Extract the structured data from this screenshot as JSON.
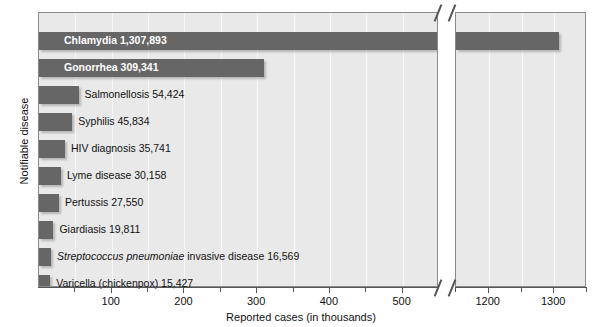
{
  "chart_data": {
    "type": "bar",
    "orientation": "horizontal",
    "title": "",
    "xlabel": "Reported cases (in thousands)",
    "ylabel": "Notifiable disease",
    "grid": true,
    "legend": null,
    "axis_break": {
      "present": true,
      "after": 550,
      "resumes_at": 1150
    },
    "xlim_left": [
      0,
      550
    ],
    "xlim_right": [
      1150,
      1350
    ],
    "xticks": [
      100,
      200,
      300,
      400,
      500,
      1200,
      1300
    ],
    "xtick_labels": [
      "100",
      "200",
      "300",
      "400",
      "500",
      "1200",
      "1300"
    ],
    "xtick_minor": [
      50,
      150,
      250,
      350,
      450,
      1150,
      1250,
      1350
    ],
    "units": "thousands of reported cases",
    "categories": [
      "Chlamydia",
      "Gonorrhea",
      "Salmonellosis",
      "Syphilis",
      "HIV diagnosis",
      "Lyme disease",
      "Pertussis",
      "Giardiasis",
      "Streptococcus pneumoniae invasive disease",
      "Varicella (chickenpox)"
    ],
    "values": [
      1307.893,
      309.341,
      54.424,
      45.834,
      35.741,
      30.158,
      27.55,
      19.811,
      16.569,
      15.427
    ],
    "value_labels": [
      "1,307,893",
      "309,341",
      "54,424",
      "45,834",
      "35,741",
      "30,158",
      "27,550",
      "19,811",
      "16,569",
      "15,427"
    ],
    "bars": [
      {
        "name": "Chlamydia",
        "value": 1307.893,
        "label": "Chlamydia  1,307,893",
        "label_inside": true,
        "italic_prefix": ""
      },
      {
        "name": "Gonorrhea",
        "value": 309.341,
        "label": "Gonorrhea  309,341",
        "label_inside": true,
        "italic_prefix": ""
      },
      {
        "name": "Salmonellosis",
        "value": 54.424,
        "label": "Salmonellosis  54,424",
        "label_inside": false,
        "italic_prefix": ""
      },
      {
        "name": "Syphilis",
        "value": 45.834,
        "label": "Syphilis  45,834",
        "label_inside": false,
        "italic_prefix": ""
      },
      {
        "name": "HIV diagnosis",
        "value": 35.741,
        "label": "HIV diagnosis 35,741",
        "label_inside": false,
        "italic_prefix": ""
      },
      {
        "name": "Lyme disease",
        "value": 30.158,
        "label": "Lyme disease  30,158",
        "label_inside": false,
        "italic_prefix": ""
      },
      {
        "name": "Pertussis",
        "value": 27.55,
        "label": "Pertussis  27,550",
        "label_inside": false,
        "italic_prefix": ""
      },
      {
        "name": "Giardiasis",
        "value": 19.811,
        "label": "Giardiasis  19,811",
        "label_inside": false,
        "italic_prefix": ""
      },
      {
        "name": "Streptococcus pneumoniae invasive disease",
        "value": 16.569,
        "label": " invasive disease  16,569",
        "label_inside": false,
        "italic_prefix": "Streptococcus pneumoniae"
      },
      {
        "name": "Varicella (chickenpox)",
        "value": 15.427,
        "label": "Varicella (chickenpox)  15,427",
        "label_inside": false,
        "italic_prefix": ""
      }
    ],
    "colors": {
      "bar": "#666666",
      "panel_background": "#e9e9e9",
      "gridline": "#f7f7f7",
      "axis": "#555555",
      "text": "#111111",
      "inside_label": "#ffffff"
    }
  }
}
